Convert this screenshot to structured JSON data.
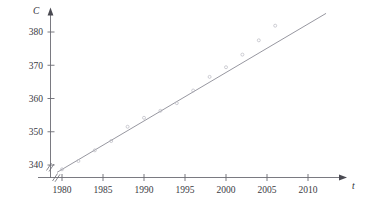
{
  "chart_data": {
    "type": "scatter",
    "title": "",
    "subtitle": "",
    "xlabel": "t",
    "ylabel": "C",
    "xlim": [
      1978.5,
      2011.5
    ],
    "ylim": [
      336.0,
      384.0
    ],
    "grid": false,
    "legend": "none",
    "axis_break_x": true,
    "axis_break_y": true,
    "xticks": [
      1980,
      1985,
      1990,
      1995,
      2000,
      2005,
      2010
    ],
    "xtick_labels": [
      "1980",
      "1985",
      "1990",
      "1995",
      "2000",
      "2005",
      "2010"
    ],
    "yticks": [
      340,
      350,
      360,
      370,
      380
    ],
    "ytick_labels": [
      "340",
      "350",
      "360",
      "370",
      "380"
    ],
    "series": [
      {
        "name": "CO2 concentration",
        "marker": "open-circle",
        "x": [
          1980,
          1982,
          1984,
          1986,
          1988,
          1990,
          1992,
          1994,
          1996,
          1998,
          2000,
          2002,
          2004,
          2006
        ],
        "y": [
          338.7,
          341.2,
          344.4,
          347.2,
          351.5,
          354.2,
          356.3,
          358.6,
          362.4,
          366.5,
          369.4,
          373.2,
          377.5,
          381.9
        ]
      }
    ],
    "fit_line": {
      "name": "regression line",
      "x_start": 1979.4,
      "y_start": 337.8,
      "x_end": 2012.2,
      "y_end": 385.6
    }
  },
  "axis_titles": {
    "y": "C",
    "x": "t"
  }
}
